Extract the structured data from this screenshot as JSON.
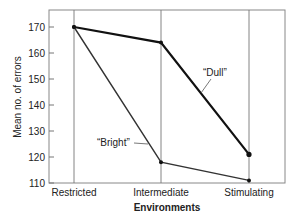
{
  "chart_data": {
    "type": "line",
    "title": "",
    "xlabel": "Environments",
    "ylabel": "Mean no. of errors",
    "categories": [
      "Restricted",
      "Intermediate",
      "Stimulating"
    ],
    "series": [
      {
        "name": "“Dull”",
        "values": [
          170,
          164,
          121
        ],
        "color": "#111111",
        "width": 2.2
      },
      {
        "name": "“Bright”",
        "values": [
          170,
          118,
          111
        ],
        "color": "#333333",
        "width": 1.4
      }
    ],
    "ylim": [
      110,
      176
    ],
    "yticks": [
      110,
      120,
      130,
      140,
      150,
      160,
      170
    ],
    "grid": "vertical lines at categories",
    "legend": "inline annotations"
  },
  "annotations": {
    "dull_label": "“Dull”",
    "bright_label": "“Bright”"
  }
}
